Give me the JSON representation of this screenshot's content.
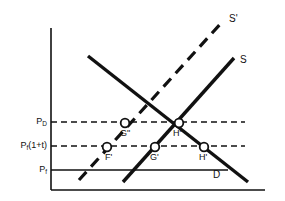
{
  "figure": {
    "type": "supply-demand-tariff-diagram",
    "background_color": "#ffffff",
    "line_color": "#111111",
    "axes": {
      "y_axis_name": "price-axis",
      "x_axis_name": "quantity-axis",
      "x_label": "",
      "y_label": ""
    },
    "price_levels": [
      {
        "id": "pd",
        "label_main": "P",
        "label_sub": "D",
        "style": "dashed",
        "y": 122
      },
      {
        "id": "pf_tax",
        "label_main": "P",
        "label_sub": "f",
        "label_suffix": "(1+t)",
        "style": "dashed",
        "y": 146
      },
      {
        "id": "pf",
        "label_main": "P",
        "label_sub": "f",
        "style": "solid",
        "y": 170
      }
    ],
    "curves": [
      {
        "id": "demand",
        "label": "D",
        "style": "solid",
        "slope": "downward",
        "label_x": 213,
        "label_y": 176
      },
      {
        "id": "supply",
        "label": "S",
        "style": "solid",
        "slope": "upward",
        "label_x": 240,
        "label_y": 55
      },
      {
        "id": "supply_shifted",
        "label": "S'",
        "style": "dashed",
        "slope": "upward",
        "label_x": 229,
        "label_y": 14
      }
    ],
    "points": [
      {
        "id": "g_double_prime",
        "label": "G\"",
        "x": 125,
        "y": 123,
        "label_x": 122,
        "label_y": 130
      },
      {
        "id": "f_prime",
        "label": "F'",
        "x": 107,
        "y": 147,
        "label_x": 107,
        "label_y": 154
      },
      {
        "id": "g_prime",
        "label": "G'",
        "x": 155,
        "y": 147,
        "label_x": 151,
        "label_y": 154
      },
      {
        "id": "h_double_prime",
        "label": "H\"",
        "x": 179,
        "y": 123,
        "label_x": 174,
        "label_y": 130
      },
      {
        "id": "h_prime",
        "label": "H'",
        "x": 204,
        "y": 147,
        "label_x": 200,
        "label_y": 154
      }
    ]
  }
}
